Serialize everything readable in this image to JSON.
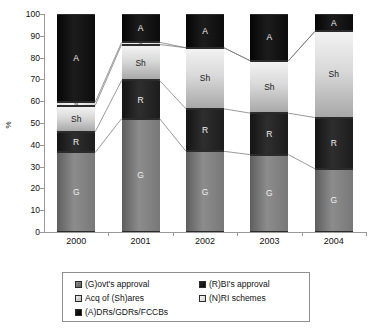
{
  "chart_data": {
    "type": "bar",
    "subtype": "stacked-100-percent",
    "title": "",
    "xlabel": "",
    "ylabel": "%",
    "ylim": [
      0,
      100
    ],
    "ytick_labels": [
      "0",
      "10",
      "20",
      "30",
      "40",
      "50",
      "60",
      "70",
      "80",
      "90",
      "100"
    ],
    "ytick_values": [
      0,
      10,
      20,
      30,
      40,
      50,
      60,
      70,
      80,
      90,
      100
    ],
    "grid": false,
    "legend_position": "bottom",
    "categories": [
      "2000",
      "2001",
      "2002",
      "2003",
      "2004"
    ],
    "series": [
      {
        "key": "G",
        "name": "(G)ovt's approval",
        "label": "G",
        "color": "#787878",
        "values": [
          36.5,
          52.0,
          37.0,
          35.5,
          29.0
        ]
      },
      {
        "key": "R",
        "name": "(R)BI's approval",
        "label": "R",
        "color": "#1a1a1a",
        "values": [
          9.5,
          17.5,
          19.5,
          19.0,
          23.5
        ]
      },
      {
        "key": "Sh",
        "name": "Acq of (Sh)ares",
        "label": "Sh",
        "color": "#c9c9c9",
        "values": [
          12.0,
          16.5,
          28.0,
          24.0,
          39.5
        ]
      },
      {
        "key": "N",
        "name": "(N)RI schemes",
        "label": "N",
        "color": "#e8e8e8",
        "values": [
          1.5,
          1.0,
          0.0,
          0.0,
          0.0
        ]
      },
      {
        "key": "A",
        "name": "(A)DRs/GDRs/FCCBs",
        "label": "A",
        "color": "#000000",
        "values": [
          40.5,
          13.0,
          15.5,
          21.5,
          8.0
        ]
      }
    ],
    "cumulative_tops": {
      "2000": {
        "G": 36.5,
        "R": 46.0,
        "Sh": 58.0,
        "N": 59.5,
        "A": 100
      },
      "2001": {
        "G": 52.0,
        "R": 69.5,
        "Sh": 86.0,
        "N": 87.0,
        "A": 100
      },
      "2002": {
        "G": 37.0,
        "R": 56.5,
        "Sh": 84.5,
        "N": 84.5,
        "A": 100
      },
      "2003": {
        "G": 35.5,
        "R": 54.5,
        "Sh": 78.5,
        "N": 78.5,
        "A": 100
      },
      "2004": {
        "G": 29.0,
        "R": 52.5,
        "Sh": 92.0,
        "N": 92.0,
        "A": 100
      }
    },
    "annotations": []
  },
  "legend": {
    "items": [
      {
        "label": "(G)ovt's approval",
        "swatch": "sw-G",
        "icon": "legend-swatch-govt"
      },
      {
        "label": "(R)BI's approval",
        "swatch": "sw-R",
        "icon": "legend-swatch-rbi"
      },
      {
        "label": "Acq of (Sh)ares",
        "swatch": "sw-Sh",
        "icon": "legend-swatch-shares"
      },
      {
        "label": "(N)RI schemes",
        "swatch": "sw-N",
        "icon": "legend-swatch-nri"
      },
      {
        "label": "(A)DRs/GDRs/FCCBs",
        "swatch": "sw-A",
        "icon": "legend-swatch-adr"
      }
    ]
  }
}
